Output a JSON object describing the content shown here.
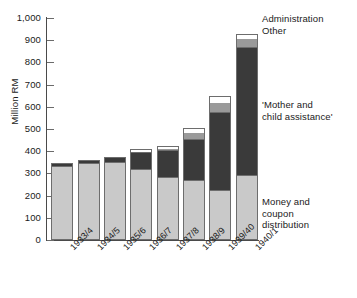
{
  "chart_data": {
    "type": "bar",
    "stacked": true,
    "title": "",
    "xlabel": "",
    "ylabel": "Million RM",
    "ylim": [
      0,
      1000
    ],
    "ytick_labels": [
      "1,000",
      "900",
      "800",
      "700",
      "600",
      "500",
      "400",
      "300",
      "200",
      "100",
      "0"
    ],
    "ytick_values": [
      1000,
      900,
      800,
      700,
      600,
      500,
      400,
      300,
      200,
      100,
      0
    ],
    "grid": false,
    "legend_position": "right-inline-annotations",
    "categories": [
      "1933/4",
      "1934/5",
      "1935/6",
      "1936/7",
      "1937/8",
      "1938/9",
      "1939/40",
      "1940/1"
    ],
    "series": [
      {
        "name": "Money and coupon distribution",
        "color": "#c9c9c9",
        "values": [
          335,
          345,
          352,
          318,
          282,
          268,
          222,
          291
        ]
      },
      {
        "name": "'Mother and child assistance'",
        "color": "#3a3a3a",
        "values": [
          14,
          17,
          21,
          78,
          122,
          187,
          352,
          578
        ]
      },
      {
        "name": "Other",
        "color": "#9a9a9a",
        "values": [
          0,
          0,
          0,
          6,
          11,
          32,
          47,
          41
        ]
      },
      {
        "name": "Administration",
        "color": "#ffffff",
        "values": [
          0,
          0,
          0,
          8,
          9,
          16,
          26,
          20
        ]
      }
    ],
    "totals": [
      349,
      362,
      373,
      410,
      424,
      503,
      647,
      930
    ],
    "annotations": [
      {
        "key": "admin",
        "text": "Administration"
      },
      {
        "key": "other",
        "text": "Other"
      },
      {
        "key": "mother",
        "text": "'Mother and\nchild assistance'"
      },
      {
        "key": "money",
        "text": "Money and\ncoupon\ndistribution"
      }
    ]
  },
  "axis": {
    "y_title": "Million RM"
  },
  "colors": {
    "money": "#c9c9c9",
    "mother": "#3a3a3a",
    "other": "#9a9a9a",
    "admin": "#ffffff",
    "outline": "#6d6d6d",
    "axis": "#4a4a4a",
    "text": "#1a1a1a",
    "background": "#ffffff"
  }
}
